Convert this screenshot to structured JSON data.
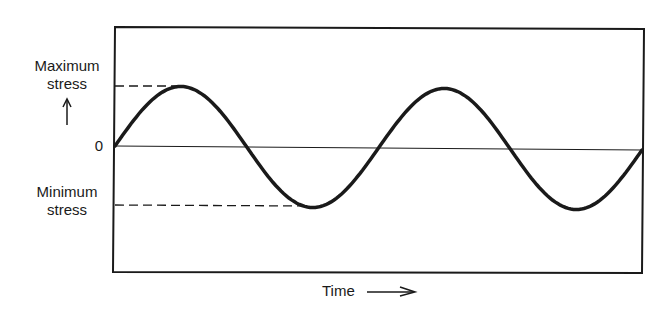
{
  "labels": {
    "max_line1": "Maximum",
    "max_line2": "stress",
    "min_line1": "Minimum",
    "min_line2": "stress",
    "zero": "0",
    "time": "Time"
  },
  "colors": {
    "ink": "#1a1a1a",
    "background": "#ffffff"
  },
  "chart_data": {
    "type": "line",
    "title": "",
    "xlabel": "Time",
    "ylabel": "Stress",
    "y_tick_labels": [
      "Maximum stress",
      "0",
      "Minimum stress"
    ],
    "series": [
      {
        "name": "stress",
        "function": "sine",
        "amplitude": 1,
        "mean": 0,
        "cycles": 2,
        "x": [
          0,
          0.25,
          0.5,
          0.75,
          1.0,
          1.25,
          1.5,
          1.75,
          2.0
        ],
        "values": [
          0,
          1,
          0,
          -1,
          0,
          1,
          0,
          -1,
          0
        ]
      }
    ],
    "reference_lines": [
      {
        "name": "maximum-stress",
        "y": 1,
        "style": "dashed"
      },
      {
        "name": "zero",
        "y": 0,
        "style": "solid-thin"
      },
      {
        "name": "minimum-stress",
        "y": -1,
        "style": "dashed"
      }
    ],
    "ylim": [
      -2,
      2
    ],
    "grid": false,
    "legend": "none"
  }
}
